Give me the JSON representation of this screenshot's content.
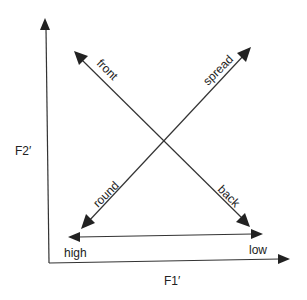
{
  "axes": {
    "y_label": "F2′",
    "x_label": "F1′"
  },
  "horizontal_scale": {
    "left_label": "high",
    "right_label": "low"
  },
  "diagonals": {
    "front_back": {
      "start_label": "front",
      "end_label": "back"
    },
    "spread_round": {
      "start_label": "spread",
      "end_label": "round"
    }
  },
  "colors": {
    "line": "#333333",
    "background": "#ffffff"
  }
}
